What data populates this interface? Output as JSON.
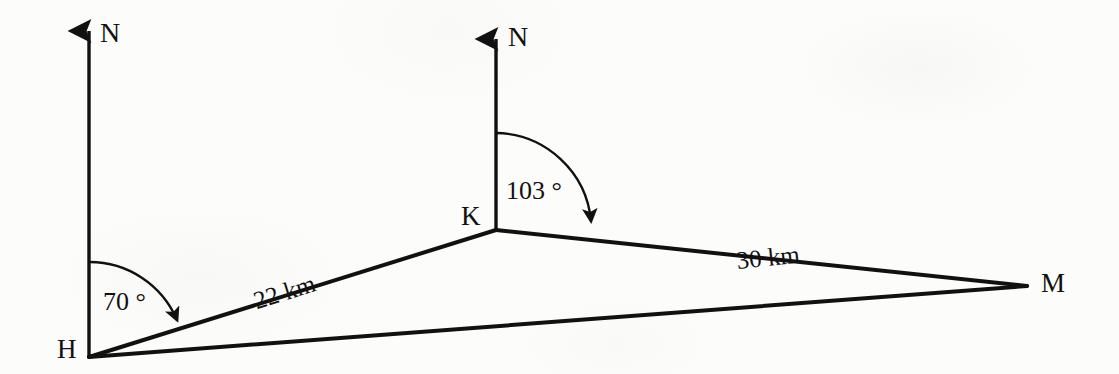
{
  "figure": {
    "kind": "bearing-triangle-diagram",
    "ink_color": "#111111",
    "background_color": "#fcfcfb",
    "vertices": [
      {
        "id": "H",
        "label": "H",
        "x": 89,
        "y": 357
      },
      {
        "id": "K",
        "label": "K",
        "x": 496,
        "y": 230
      },
      {
        "id": "M",
        "label": "M",
        "x": 1027,
        "y": 286
      }
    ],
    "compass_arrows": [
      {
        "id": "north-at-H",
        "label": "N",
        "base_x": 89,
        "base_y": 357,
        "tip_x": 89,
        "tip_y": 25
      },
      {
        "id": "north-at-K",
        "label": "N",
        "base_x": 496,
        "base_y": 230,
        "tip_x": 496,
        "tip_y": 33
      }
    ],
    "angles": [
      {
        "id": "bearing-at-H",
        "label": "70 °",
        "value": 70,
        "unit": "degrees",
        "at_vertex": "H",
        "from": "north-at-H",
        "to": "K"
      },
      {
        "id": "bearing-at-K",
        "label": "103 °",
        "value": 103,
        "unit": "degrees",
        "at_vertex": "K",
        "from": "north-at-K",
        "to": "M"
      }
    ],
    "sides": [
      {
        "id": "HK",
        "label": "22 km",
        "value": 22,
        "unit": "km",
        "from": "H",
        "to": "K"
      },
      {
        "id": "KM",
        "label": "30 km",
        "value": 30,
        "unit": "km",
        "from": "K",
        "to": "M"
      },
      {
        "id": "HM",
        "label": "",
        "from": "H",
        "to": "M"
      }
    ]
  }
}
